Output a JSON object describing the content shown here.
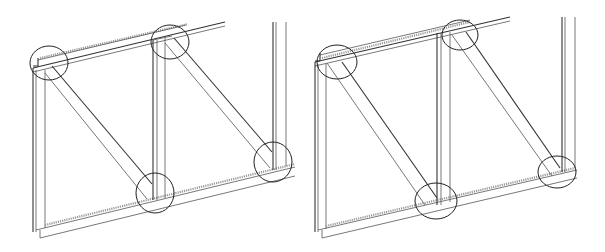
{
  "figure": {
    "colors": {
      "background": "#ffffff",
      "line": "#333333",
      "hatch": "#999999",
      "circle": "#222222"
    },
    "panels": [
      {
        "id": "left",
        "offset_x": 0,
        "joints": [
          {
            "cx": 49,
            "cy": 63,
            "rx": 19,
            "ry": 17
          },
          {
            "cx": 170,
            "cy": 42,
            "rx": 19,
            "ry": 17
          },
          {
            "cx": 155,
            "cy": 193,
            "rx": 19,
            "ry": 20
          },
          {
            "cx": 273,
            "cy": 162,
            "rx": 19,
            "ry": 20
          }
        ]
      },
      {
        "id": "right",
        "offset_x": 300,
        "joints": [
          {
            "cx": 337,
            "cy": 62,
            "rx": 20,
            "ry": 17
          },
          {
            "cx": 460,
            "cy": 35,
            "rx": 18,
            "ry": 15
          },
          {
            "cx": 436,
            "cy": 201,
            "rx": 21,
            "ry": 18
          },
          {
            "cx": 557,
            "cy": 172,
            "rx": 19,
            "ry": 16
          }
        ]
      }
    ]
  }
}
